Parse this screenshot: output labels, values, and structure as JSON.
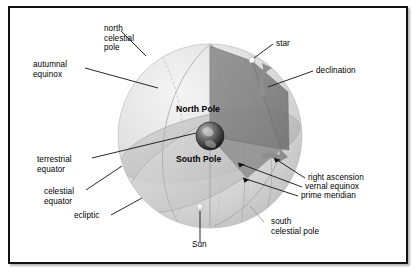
{
  "figure": {
    "frame_border_color": "#111111",
    "background_color": "#ffffff"
  },
  "colors": {
    "sphere_light": "#e9e9e9",
    "sphere_mid": "#d5d5d5",
    "sphere_shadow": "#c2c2c2",
    "ecliptic_plane": "#cfcfcf",
    "equator_plane": "#bdbdbd",
    "wedge_dark": "#8f8f8f",
    "wedge_darker": "#7c7c7c",
    "arrow_gray": "#9a9a9a",
    "leader_line": "#111111",
    "earth_dark": "#2b2b2b",
    "star_white": "#ffffff",
    "sun_white": "#f2f2f2"
  },
  "labels": {
    "north_celestial_pole": "north\ncelestial\npole",
    "autumnal_equinox": "autumnal\nequinox",
    "terrestrial_equator": "terrestrial\nequator",
    "celestial_equator": "celestial\nequator",
    "ecliptic": "ecliptic",
    "sun": "Sun",
    "south_celestial_pole": "south\ncelestial pole",
    "prime_meridian": "prime meridian",
    "vernal_equinox": "vernal equinox",
    "right_ascension": "right ascension",
    "declination": "declination",
    "star": "star",
    "north_pole": "North Pole",
    "south_pole": "South Pole"
  },
  "label_list": [
    {
      "key": "north_celestial_pole",
      "text": "north celestial pole",
      "side": "top-left"
    },
    {
      "key": "autumnal_equinox",
      "text": "autumnal equinox",
      "side": "left"
    },
    {
      "key": "terrestrial_equator",
      "text": "terrestrial equator",
      "side": "left"
    },
    {
      "key": "celestial_equator",
      "text": "celestial equator",
      "side": "left"
    },
    {
      "key": "ecliptic",
      "text": "ecliptic",
      "side": "bottom-left"
    },
    {
      "key": "sun",
      "text": "Sun",
      "side": "bottom"
    },
    {
      "key": "south_celestial_pole",
      "text": "south celestial pole",
      "side": "bottom-right"
    },
    {
      "key": "prime_meridian",
      "text": "prime meridian",
      "side": "right"
    },
    {
      "key": "vernal_equinox",
      "text": "vernal equinox",
      "side": "right"
    },
    {
      "key": "right_ascension",
      "text": "right ascension",
      "side": "right"
    },
    {
      "key": "declination",
      "text": "declination",
      "side": "top-right"
    },
    {
      "key": "star",
      "text": "star",
      "side": "top-right"
    },
    {
      "key": "north_pole",
      "text": "North Pole",
      "side": "center"
    },
    {
      "key": "south_pole",
      "text": "South Pole",
      "side": "center"
    }
  ]
}
